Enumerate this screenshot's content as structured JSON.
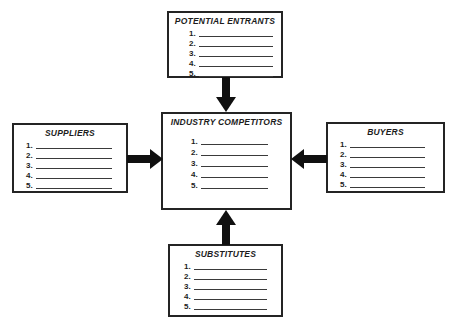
{
  "boxes": {
    "potential_entrants": {
      "title": "POTENTIAL ENTRANTS",
      "items": [
        "1.",
        "2.",
        "3.",
        "4.",
        "5."
      ]
    },
    "suppliers": {
      "title": "SUPPLIERS",
      "items": [
        "1.",
        "2.",
        "3.",
        "4.",
        "5."
      ]
    },
    "industry_competitors": {
      "title": "INDUSTRY COMPETITORS",
      "items": [
        "1.",
        "2.",
        "3.",
        "4.",
        "5."
      ]
    },
    "buyers": {
      "title": "BUYERS",
      "items": [
        "1.",
        "2.",
        "3.",
        "4.",
        "5."
      ]
    },
    "substitutes": {
      "title": "SUBSTITUTES",
      "items": [
        "1.",
        "2.",
        "3.",
        "4.",
        "5."
      ]
    }
  },
  "arrows": [
    {
      "name": "potential-entrants-to-industry-competitors",
      "direction": "down"
    },
    {
      "name": "suppliers-to-industry-competitors",
      "direction": "right"
    },
    {
      "name": "buyers-to-industry-competitors",
      "direction": "left"
    },
    {
      "name": "substitutes-to-industry-competitors",
      "direction": "up"
    }
  ],
  "colors": {
    "ink": "#1c1c1c",
    "box_border": "#242424",
    "arrow": "#101010",
    "blank_line": "#3a3a3a",
    "background": "#ffffff"
  }
}
